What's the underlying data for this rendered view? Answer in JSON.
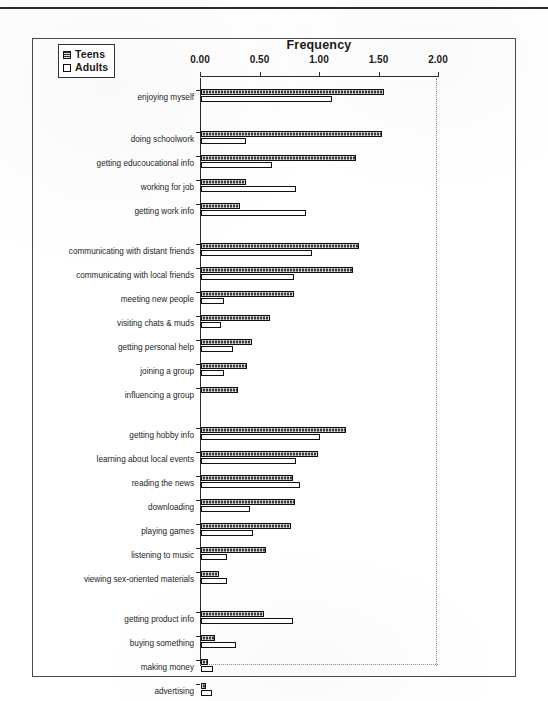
{
  "figure": {
    "title": "Frequency",
    "legend": [
      {
        "key": "teens",
        "label": "Teens"
      },
      {
        "key": "adults",
        "label": "Adults"
      }
    ]
  },
  "chart_data": {
    "type": "bar",
    "orientation": "horizontal",
    "title": "Frequency",
    "xlabel": "Frequency",
    "ylabel": "",
    "xlim": [
      0.0,
      2.0
    ],
    "xticks": [
      "0.00",
      "0.50",
      "1.00",
      "1.50",
      "2.00"
    ],
    "xtick_values": [
      0.0,
      0.5,
      1.0,
      1.5,
      2.0
    ],
    "grid": false,
    "legend_position": "top-left",
    "legend": [
      "Teens",
      "Adults"
    ],
    "series": [
      {
        "name": "Teens",
        "values": [
          1.54,
          1.52,
          1.3,
          0.38,
          0.33,
          1.33,
          1.28,
          0.78,
          0.58,
          0.43,
          0.39,
          0.31,
          1.22,
          0.98,
          0.77,
          0.79,
          0.76,
          0.55,
          0.15,
          0.53,
          0.12,
          0.06,
          0.04,
          0.03
        ]
      },
      {
        "name": "Adults",
        "values": [
          1.1,
          0.38,
          0.6,
          0.8,
          0.88,
          0.93,
          0.78,
          0.19,
          0.17,
          0.27,
          0.19,
          0.0,
          1.0,
          0.8,
          0.83,
          0.41,
          0.44,
          0.22,
          0.22,
          0.77,
          0.29,
          0.1,
          0.09,
          0.02
        ]
      }
    ],
    "groups": [
      {
        "name": "group-1",
        "categories": [
          "enjoying myself",
          "doing schoolwork",
          "getting educoucational info",
          "working for job",
          "getting work info"
        ]
      },
      {
        "name": "group-2",
        "categories": [
          "communicating with distant friends",
          "communicating with local friends",
          "meeting new people",
          "visiting chats & muds",
          "getting personal help",
          "joining a group",
          "influencing a group"
        ]
      },
      {
        "name": "group-3",
        "categories": [
          "getting hobby info",
          "learning about local events",
          "reading the news",
          "downloading",
          "playing games",
          "listening to music",
          "viewing sex-oriented materials"
        ]
      },
      {
        "name": "group-4",
        "categories": [
          "getting product info",
          "buying something",
          "making money",
          "advertising",
          "selling something"
        ]
      }
    ],
    "categories": [
      "enjoying myself",
      "doing schoolwork",
      "getting educoucational info",
      "working for job",
      "getting work info",
      "communicating with distant friends",
      "communicating with local friends",
      "meeting new people",
      "visiting chats & muds",
      "getting personal help",
      "joining a group",
      "influencing a group",
      "getting hobby info",
      "learning about local events",
      "reading the news",
      "downloading",
      "playing games",
      "listening to music",
      "viewing sex-oriented materials",
      "getting product info",
      "buying something",
      "making money",
      "advertising",
      "selling something"
    ],
    "row_y": [
      14,
      56,
      80,
      104,
      128,
      168,
      192,
      216,
      240,
      264,
      288,
      312,
      352,
      376,
      400,
      424,
      448,
      472,
      496,
      536,
      560,
      584,
      608,
      632
    ],
    "colors": {
      "teens": "#3a3a3a",
      "adults": "#ffffff",
      "axis": "#2b2b2b",
      "frame": "#4a4a4a"
    }
  }
}
